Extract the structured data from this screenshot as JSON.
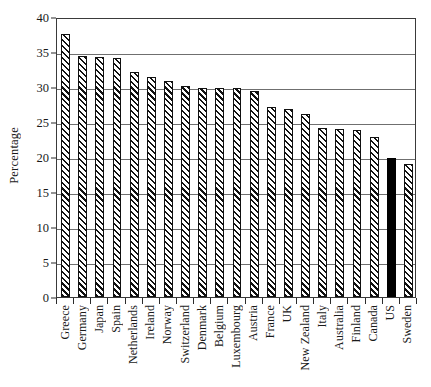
{
  "chart_data": {
    "type": "bar",
    "title": "",
    "xlabel": "",
    "ylabel": "Percentage",
    "ylim": [
      0,
      40
    ],
    "ytick_values": [
      0,
      5,
      10,
      15,
      20,
      25,
      30,
      35,
      40
    ],
    "ytick_labels": [
      "0",
      "5",
      "10",
      "15",
      "20",
      "25",
      "30",
      "35",
      "40"
    ],
    "grid": "horizontal",
    "legend": "none",
    "categories": [
      "Greece",
      "Germany",
      "Japan",
      "Spain",
      "Netherlands",
      "Ireland",
      "Norway",
      "Switzerland",
      "Denmark",
      "Belgium",
      "Luxembourg",
      "Austria",
      "France",
      "UK",
      "New Zealand",
      "Italy",
      "Australia",
      "Finland",
      "Canada",
      "US",
      "Sweden"
    ],
    "values": [
      37.6,
      34.5,
      34.3,
      34.2,
      32.2,
      31.4,
      30.8,
      30.2,
      29.9,
      29.9,
      29.8,
      29.5,
      27.2,
      26.9,
      26.1,
      24.2,
      24.0,
      23.9,
      22.9,
      19.8,
      19.0
    ],
    "highlight_category": "US",
    "highlight_color": "#000000",
    "bar_fill": "hatched-diagonal",
    "bar_edge_color": "#111111"
  }
}
